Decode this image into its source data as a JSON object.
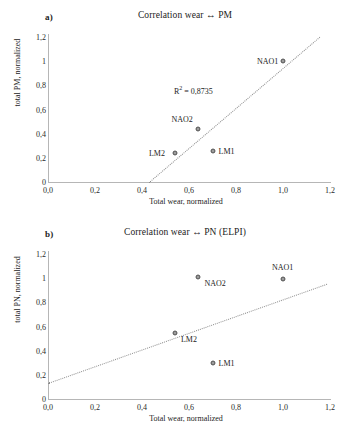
{
  "figure": {
    "width": 352,
    "height": 434,
    "background": "#ffffff",
    "marker_color": "#7b7b7b",
    "trendline_color": "#8e8e8e",
    "axis_color": "#b6b6b6"
  },
  "panels": [
    {
      "letter": "a)",
      "title": "Correlation wear ↔ PM",
      "xlabel": "Total wear, normalized",
      "ylabel": "total PM, normalized",
      "xticks": [
        "0,0",
        "0,2",
        "0,4",
        "0,6",
        "0,8",
        "1,0",
        "1,2"
      ],
      "yticks": [
        "0",
        "0,2",
        "0,4",
        "0,6",
        "0,8",
        "1",
        "1,2"
      ],
      "r2_text": "R² = 0,8735",
      "points": [
        {
          "label": "NAO1",
          "x": 1.0,
          "y": 1.0,
          "label_pos": "left"
        },
        {
          "label": "NAO2",
          "x": 0.64,
          "y": 0.44,
          "label_pos": "above-left"
        },
        {
          "label": "LM2",
          "x": 0.54,
          "y": 0.24,
          "label_pos": "left"
        },
        {
          "label": "LM1",
          "x": 0.7,
          "y": 0.26,
          "label_pos": "right"
        }
      ],
      "trendline": {
        "x0": 0.43,
        "y0": 0.0,
        "x1": 1.155,
        "y1": 1.2
      }
    },
    {
      "letter": "b)",
      "title": "Correlation wear ↔ PN (ELPI)",
      "xlabel": "Total wear, normalized",
      "ylabel": "total PN, normalized",
      "xticks": [
        "0,0",
        "0,2",
        "0,4",
        "0,6",
        "0,8",
        "1,0",
        "1,2"
      ],
      "yticks": [
        "0",
        "0,2",
        "0,4",
        "0,6",
        "0,8",
        "1",
        "1,2"
      ],
      "r2_text": "R² = 0,2078",
      "points": [
        {
          "label": "NAO1",
          "x": 1.0,
          "y": 0.99,
          "label_pos": "above"
        },
        {
          "label": "NAO2",
          "x": 0.64,
          "y": 1.01,
          "label_pos": "right-below"
        },
        {
          "label": "LM2",
          "x": 0.54,
          "y": 0.545,
          "label_pos": "right-below"
        },
        {
          "label": "LM1",
          "x": 0.7,
          "y": 0.3,
          "label_pos": "right"
        }
      ],
      "trendline": {
        "x0": 0.0,
        "y0": 0.135,
        "x1": 1.185,
        "y1": 0.955
      }
    }
  ],
  "chart_data": [
    {
      "type": "scatter",
      "title": "Correlation wear ↔ PM",
      "panel": "a)",
      "xlabel": "Total wear, normalized",
      "ylabel": "total PM, normalized",
      "xlim": [
        0,
        1.2
      ],
      "ylim": [
        0,
        1.2
      ],
      "xticks": [
        0,
        0.2,
        0.4,
        0.6,
        0.8,
        1.0,
        1.2
      ],
      "yticks": [
        0,
        0.2,
        0.4,
        0.6,
        0.8,
        1.0,
        1.2
      ],
      "grid": false,
      "legend": "none",
      "annotations": [
        "R² = 0,8735"
      ],
      "r_squared": 0.8735,
      "points": [
        {
          "name": "NAO1",
          "x": 1.0,
          "y": 1.0
        },
        {
          "name": "NAO2",
          "x": 0.64,
          "y": 0.44
        },
        {
          "name": "LM2",
          "x": 0.54,
          "y": 0.24
        },
        {
          "name": "LM1",
          "x": 0.7,
          "y": 0.26
        }
      ],
      "trendline": {
        "style": "dotted",
        "from": [
          0.43,
          0.0
        ],
        "to": [
          1.155,
          1.2
        ]
      }
    },
    {
      "type": "scatter",
      "title": "Correlation wear ↔ PN (ELPI)",
      "panel": "b)",
      "xlabel": "Total wear, normalized",
      "ylabel": "total PN, normalized",
      "xlim": [
        0,
        1.2
      ],
      "ylim": [
        0,
        1.2
      ],
      "xticks": [
        0,
        0.2,
        0.4,
        0.6,
        0.8,
        1.0,
        1.2
      ],
      "yticks": [
        0,
        0.2,
        0.4,
        0.6,
        0.8,
        1.0,
        1.2
      ],
      "grid": false,
      "legend": "none",
      "annotations": [
        "R² = 0,2078"
      ],
      "r_squared": 0.2078,
      "points": [
        {
          "name": "NAO1",
          "x": 1.0,
          "y": 0.99
        },
        {
          "name": "NAO2",
          "x": 0.64,
          "y": 1.01
        },
        {
          "name": "LM2",
          "x": 0.54,
          "y": 0.545
        },
        {
          "name": "LM1",
          "x": 0.7,
          "y": 0.3
        }
      ],
      "trendline": {
        "style": "dotted",
        "from": [
          0.0,
          0.135
        ],
        "to": [
          1.185,
          0.955
        ]
      }
    }
  ]
}
